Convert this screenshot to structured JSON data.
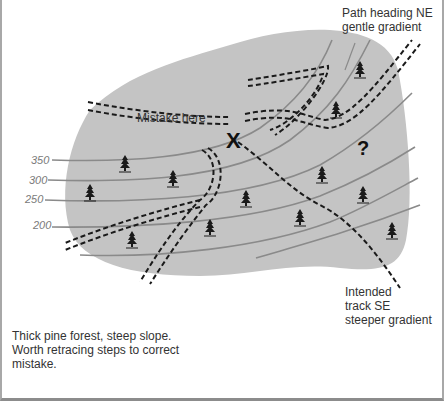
{
  "annotations": {
    "path_ne": "Path heading NE\ngentle gradient",
    "mistake": "Mistake here",
    "intended_track": "Intended\ntrack SE\nsteeper gradient",
    "note": "Thick pine forest, steep slope.\nWorth retracing steps to correct\nmistake."
  },
  "contours": {
    "labels": [
      "350",
      "300",
      "250",
      "200"
    ]
  },
  "symbols": {
    "error_mark": "X",
    "unknown_mark": "?",
    "tree_icon": "pine-tree-icon"
  },
  "colors": {
    "area_fill": "#c4c4c4",
    "contour_line": "#8a8a8a",
    "path_line": "#1a1a1a",
    "text": "#333333",
    "border": "#a8a8a8"
  }
}
